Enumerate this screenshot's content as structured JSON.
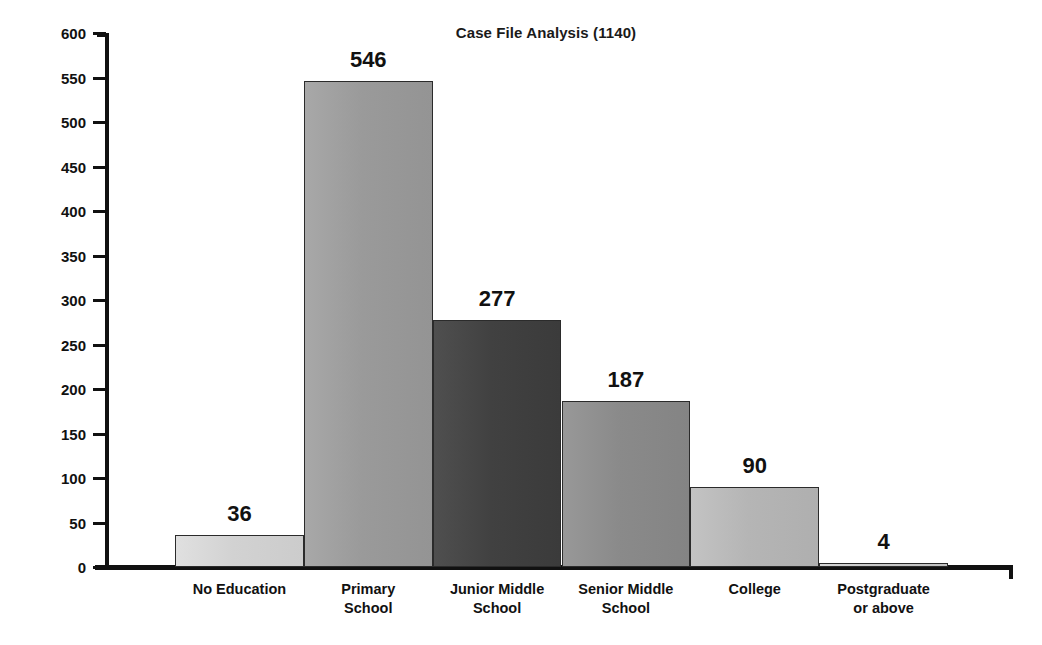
{
  "chart_data": {
    "type": "bar",
    "title": "Case File Analysis (1140)",
    "xlabel": "",
    "ylabel": "No. of cases",
    "categories": [
      "No Education",
      "Primary School",
      "Junior Middle School",
      "Senior Middle School",
      "College",
      "Postgraduate or above"
    ],
    "category_lines": [
      [
        "No Education"
      ],
      [
        "Primary",
        "School"
      ],
      [
        "Junior Middle",
        "School"
      ],
      [
        "Senior Middle",
        "School"
      ],
      [
        "College"
      ],
      [
        "Postgraduate",
        "or above"
      ]
    ],
    "values": [
      36,
      546,
      277,
      187,
      90,
      4
    ],
    "value_labels": [
      "36",
      "546",
      "277",
      "187",
      "90",
      "4"
    ],
    "ylim": [
      0,
      600
    ],
    "ytick_step": 50,
    "yticks": [
      0,
      50,
      100,
      150,
      200,
      250,
      300,
      350,
      400,
      450,
      500,
      550,
      600
    ],
    "ytick_labels": [
      "0",
      "50",
      "100",
      "150",
      "200",
      "250",
      "300",
      "350",
      "400",
      "450",
      "500",
      "550",
      "600"
    ],
    "grid": false,
    "legend": false,
    "legend_position": "none",
    "bar_colors": [
      "#d2d2d2",
      "#9a9a9a",
      "#414141",
      "#8a8a8a",
      "#b5b5b5",
      "#c8c8c8"
    ],
    "bar_edge_color": "#2b2b2b",
    "axis_color": "#111111",
    "background_color": "#ffffff",
    "total": 1140
  }
}
